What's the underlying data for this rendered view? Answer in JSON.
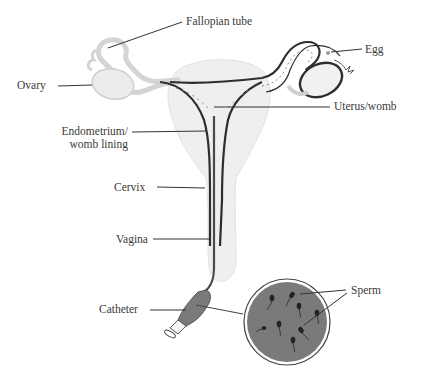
{
  "diagram": {
    "colors": {
      "background": "#ffffff",
      "outline_dark": "#2e2e2e",
      "tissue_fill": "#efefef",
      "tissue_outline": "#d8d8d8",
      "sperm_sample_fill": "#7a7a7a",
      "label_text": "#3a3a3a",
      "leader_line": "#333333"
    },
    "labels": {
      "fallopian_tube": "Fallopian tube",
      "egg": "Egg",
      "ovary": "Ovary",
      "uterus": "Uterus/womb",
      "endometrium_line1": "Endometrium/",
      "endometrium_line2": "womb lining",
      "cervix": "Cervix",
      "vagina": "Vagina",
      "catheter": "Catheter",
      "sperm": "Sperm"
    },
    "inset": {
      "name": "magnified sperm sample",
      "sperm_count": 9
    }
  }
}
